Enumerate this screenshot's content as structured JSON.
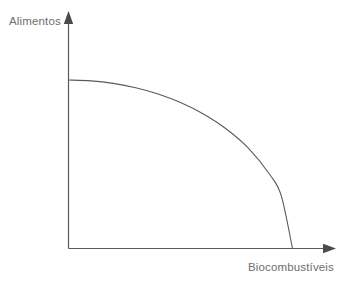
{
  "figure": {
    "background_color": "#ffffff",
    "width": 346,
    "height": 283
  },
  "axes": {
    "y_label": "Alimentos",
    "x_label": "Biocombustíveis",
    "line_color": "#5a5a5a",
    "label_color": "#6e6e6e",
    "y_arrow_icon": "arrow-up-icon",
    "x_arrow_icon": "arrow-right-icon"
  },
  "curve": {
    "color": "#5a5a5a",
    "name": "production-possibility-frontier"
  },
  "chart_data": {
    "type": "line",
    "title": "",
    "subtitle": "",
    "xlabel": "Biocombustíveis",
    "ylabel": "Alimentos",
    "xlim": [
      0,
      1
    ],
    "ylim": [
      0,
      1
    ],
    "grid": false,
    "legend": false,
    "legend_position": "none",
    "axis_style": "arrow-tipped",
    "series": [
      {
        "name": "Fronteira de Possibilidades de Produção",
        "shape": "concave-quarter-ellipse",
        "x": [
          0.0,
          0.1,
          0.2,
          0.3,
          0.4,
          0.5,
          0.6,
          0.7,
          0.8,
          0.9,
          0.95,
          1.0
        ],
        "y": [
          1.0,
          0.995,
          0.98,
          0.954,
          0.917,
          0.866,
          0.8,
          0.714,
          0.6,
          0.436,
          0.312,
          0.0
        ]
      }
    ],
    "annotations": [],
    "xticks": [],
    "yticks": [],
    "xticklabels": [],
    "yticklabels": []
  }
}
